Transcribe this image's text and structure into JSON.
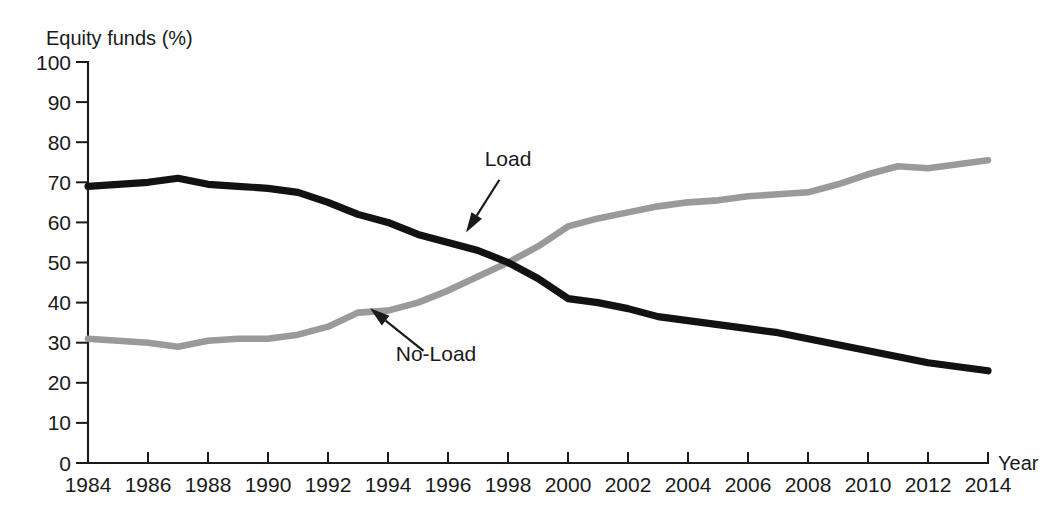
{
  "chart_data": {
    "type": "line",
    "title": "",
    "ylabel": "Equity funds (%)",
    "xlabel": "Year",
    "xlim": [
      1984,
      2014
    ],
    "ylim": [
      0,
      100
    ],
    "grid": false,
    "legend_position": "inline-annotations",
    "x": [
      1984,
      1985,
      1986,
      1987,
      1988,
      1989,
      1990,
      1991,
      1992,
      1993,
      1994,
      1995,
      1996,
      1997,
      1998,
      1999,
      2000,
      2001,
      2002,
      2003,
      2004,
      2005,
      2006,
      2007,
      2008,
      2009,
      2010,
      2011,
      2012,
      2013,
      2014
    ],
    "xticks": [
      1984,
      1986,
      1988,
      1990,
      1992,
      1994,
      1996,
      1998,
      2000,
      2002,
      2004,
      2006,
      2008,
      2010,
      2012,
      2014
    ],
    "xticklabels": [
      "1984",
      "1986",
      "1988",
      "1990",
      "1992",
      "1994",
      "1996",
      "1998",
      "2000",
      "2002",
      "2004",
      "2006",
      "2008",
      "2010",
      "2012",
      "2014"
    ],
    "yticks": [
      0,
      10,
      20,
      30,
      40,
      50,
      60,
      70,
      80,
      90,
      100
    ],
    "yticklabels": [
      "0",
      "10",
      "20",
      "30",
      "40",
      "50",
      "60",
      "70",
      "80",
      "90",
      "100"
    ],
    "series": [
      {
        "name": "Load",
        "color": "#121212",
        "values": [
          69,
          69.5,
          70,
          71,
          69.5,
          69,
          68.5,
          67.5,
          65,
          62,
          60,
          57,
          55,
          53,
          50,
          46,
          41,
          40,
          38.5,
          36.5,
          35.5,
          34.5,
          33.5,
          32.5,
          31,
          29.5,
          28,
          26.5,
          25,
          24,
          23
        ]
      },
      {
        "name": "No-Load",
        "color": "#9a9a9a",
        "values": [
          31,
          30.5,
          30,
          29,
          30.5,
          31,
          31,
          32,
          34,
          37.5,
          38,
          40,
          43,
          46.5,
          50,
          54,
          59,
          61,
          62.5,
          64,
          65,
          65.5,
          66.5,
          67,
          67.5,
          69.5,
          72,
          74,
          73.5,
          74.5,
          75.5
        ]
      }
    ],
    "annotations": [
      {
        "text": "Load",
        "series": "Load",
        "label_x": 1998,
        "label_y": 74,
        "target_x": 1996.6,
        "target_y": 57.5
      },
      {
        "text": "No-Load",
        "series": "No-Load",
        "label_x": 1995.6,
        "label_y": 25.5,
        "target_x": 1993.4,
        "target_y": 38.6
      }
    ]
  },
  "colors": {
    "load_line": "#121212",
    "noload_line": "#9a9a9a",
    "axis": "#1a1a1a",
    "background": "#ffffff"
  }
}
